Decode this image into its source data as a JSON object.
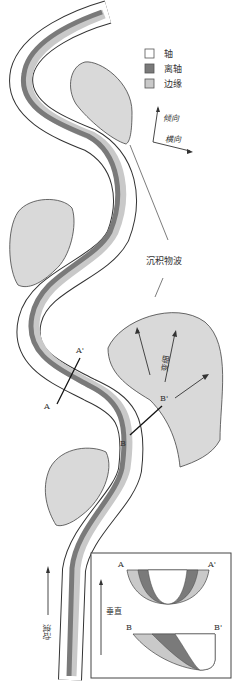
{
  "legend": {
    "items": [
      {
        "label": "轴",
        "color": "#ffffff"
      },
      {
        "label": "离轴",
        "color": "#7a7a7a"
      },
      {
        "label": "边缘",
        "color": "#c9c9c9"
      }
    ]
  },
  "orientation": {
    "dip_label": "倾向",
    "strike_label": "横向"
  },
  "annotations": {
    "sediment_waves": "沉积物波",
    "thinning": "变细",
    "flow": "流动"
  },
  "sections": {
    "a_start": "A",
    "a_end": "A'",
    "b_start": "B",
    "b_end": "B'"
  },
  "inset": {
    "vertical_label": "垂直",
    "a_start": "A",
    "a_end": "A'",
    "b_start": "B",
    "b_end": "B'"
  },
  "colors": {
    "axis": "#ffffff",
    "off_axis": "#7a7a7a",
    "margin": "#c9c9c9",
    "wave_fill": "#d9d9d9",
    "outline": "#333333"
  }
}
